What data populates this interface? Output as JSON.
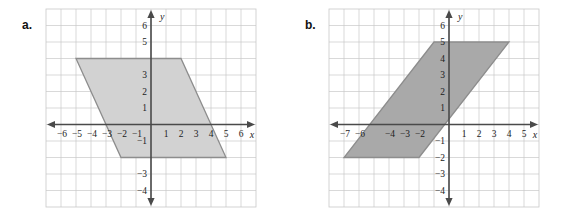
{
  "figure": {
    "width": 581,
    "height": 217,
    "background": "#ffffff",
    "panel_count": 2
  },
  "colors": {
    "grid": "#c9c9c9",
    "axis": "#4a4a4a",
    "shape_a_fill": "#d2d2d2",
    "shape_b_fill": "#a9a9a9",
    "shape_stroke": "#8d8d8d",
    "text": "#1c1c1c"
  },
  "chart_data": [
    {
      "type": "scatter",
      "panel_label": "a.",
      "title": "",
      "xlabel": "x",
      "ylabel": "y",
      "xlim": [
        -7,
        7
      ],
      "ylim": [
        -5,
        7
      ],
      "grid": true,
      "grid_step": 1,
      "legend": "none",
      "x_ticks": [
        -6,
        -5,
        -4,
        -3,
        -2,
        -1,
        1,
        2,
        3,
        4,
        5,
        6
      ],
      "x_tick_labels": [
        "−6",
        "−5",
        "−4",
        "−3",
        "−2",
        "−1",
        "1",
        "2",
        "3",
        "4",
        "5",
        "6"
      ],
      "y_ticks": [
        6,
        5,
        4,
        3,
        2,
        1,
        -1,
        -2,
        -3,
        -4
      ],
      "y_tick_labels": [
        "6",
        "5",
        "4",
        "3",
        "2",
        "1",
        "−1",
        "−2",
        "−3",
        "−4"
      ],
      "y_tick_labels_visible": [
        "6",
        "5",
        "3",
        "2",
        "1",
        "−1",
        "−3",
        "−4"
      ],
      "shapes": [
        {
          "name": "parallelogram-a",
          "kind": "parallelogram",
          "vertices": [
            [
              -5,
              4
            ],
            [
              2,
              4
            ],
            [
              5,
              -2
            ],
            [
              -2,
              -2
            ]
          ],
          "fill": "#d2d2d2",
          "stroke": "#8d8d8d"
        }
      ]
    },
    {
      "type": "scatter",
      "panel_label": "b.",
      "title": "",
      "xlabel": "x",
      "ylabel": "y",
      "xlim": [
        -8,
        6
      ],
      "ylim": [
        -5,
        7
      ],
      "grid": true,
      "grid_step": 1,
      "legend": "none",
      "x_ticks": [
        -7,
        -6,
        -5,
        -4,
        -3,
        -2,
        -1,
        1,
        2,
        3,
        4,
        5
      ],
      "x_tick_labels": [
        "−7",
        "−6",
        "−5",
        "−4",
        "−3",
        "−2",
        "−1",
        "1",
        "2",
        "3",
        "4",
        "5"
      ],
      "x_tick_labels_visible": [
        "−7",
        "−6",
        "−4",
        "−3",
        "−2",
        "1",
        "2",
        "3",
        "4",
        "5"
      ],
      "y_ticks": [
        6,
        5,
        4,
        3,
        2,
        1,
        -1,
        -2,
        -3,
        -4
      ],
      "y_tick_labels": [
        "6",
        "5",
        "4",
        "3",
        "2",
        "1",
        "−1",
        "−2",
        "−3",
        "−4"
      ],
      "shapes": [
        {
          "name": "parallelogram-b",
          "kind": "parallelogram",
          "vertices": [
            [
              -1,
              5
            ],
            [
              4,
              5
            ],
            [
              -2,
              -2
            ],
            [
              -7,
              -2
            ]
          ],
          "fill": "#a9a9a9",
          "stroke": "#8d8d8d"
        }
      ]
    }
  ],
  "panels": [
    {
      "label": "a.",
      "axis_x_name": "x",
      "axis_y_name": "y"
    },
    {
      "label": "b.",
      "axis_x_name": "x",
      "axis_y_name": "y"
    }
  ]
}
